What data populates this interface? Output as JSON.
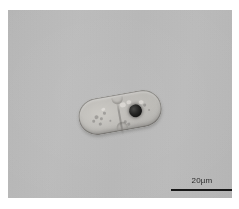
{
  "figure": {
    "type": "light-microscopy-micrograph",
    "background_color": "#ffffff",
    "field_color": "#b9b9b9",
    "caption": ""
  },
  "micrograph": {
    "label": "micrograph-field",
    "subject": "rod-shaped dividing cell with dark inclusion",
    "specimen": {
      "shape": "dumbbell / dividing rod",
      "outline_color": "#5f5d5a",
      "body_color": "#c6c4bf",
      "inclusion": {
        "name": "dark-inclusion",
        "color": "#1a1a19",
        "shape": "circular"
      },
      "septum": {
        "name": "division-septum",
        "color": "#78766f"
      }
    }
  },
  "scalebar": {
    "label": "20µm",
    "length_value": 20,
    "length_unit": "µm",
    "bar_color": "#161616",
    "text_color": "#2b2b2b"
  }
}
